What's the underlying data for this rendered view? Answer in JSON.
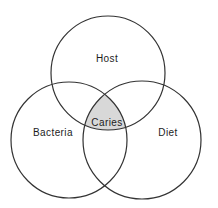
{
  "diagram": {
    "type": "venn-3-circle",
    "background_color": "#ffffff",
    "circle_stroke_color": "#333333",
    "intersection_fill_color": "#d8d8d8",
    "label_color": "#1c1c1c",
    "circles": [
      {
        "id": "host",
        "label": "Host",
        "cx": 108,
        "cy": 73,
        "r": 57,
        "label_x": 107,
        "label_y": 62
      },
      {
        "id": "bacteria",
        "label": "Bacteria",
        "cx": 69,
        "cy": 140,
        "r": 58,
        "label_x": 53,
        "label_y": 136
      },
      {
        "id": "diet",
        "label": "Diet",
        "cx": 142,
        "cy": 140,
        "r": 59,
        "label_x": 168,
        "label_y": 136
      }
    ],
    "intersection": {
      "label": "Caries",
      "label_x": 107,
      "label_y": 126
    }
  }
}
